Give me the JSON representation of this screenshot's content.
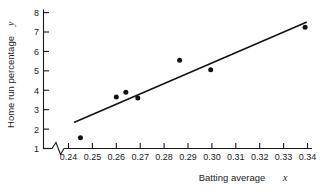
{
  "chart_data": {
    "type": "scatter",
    "title": "",
    "xlabel": "Batting average",
    "xlabel_symbol": "x",
    "ylabel": "Home run percentage",
    "ylabel_symbol": "y",
    "xlim": [
      0.2355,
      0.3435
    ],
    "ylim": [
      1,
      8.45
    ],
    "grid": false,
    "legend": null,
    "x_axis_break": true,
    "xticks": [
      0.24,
      0.25,
      0.26,
      0.27,
      0.28,
      0.29,
      0.3,
      0.31,
      0.32,
      0.33,
      0.34
    ],
    "xtick_labels": [
      "0.24",
      "0.25",
      "0.26",
      "0.27",
      "0.28",
      "0.29",
      "0.30",
      "0.31",
      "0.32",
      "0.33",
      "0.34"
    ],
    "yticks": [
      1,
      2,
      3,
      4,
      5,
      6,
      7,
      8
    ],
    "ytick_labels": [
      "1",
      "2",
      "3",
      "4",
      "5",
      "6",
      "7",
      "8"
    ],
    "points": [
      {
        "x": 0.245,
        "y": 1.55
      },
      {
        "x": 0.26,
        "y": 3.65
      },
      {
        "x": 0.264,
        "y": 3.9
      },
      {
        "x": 0.269,
        "y": 3.6
      },
      {
        "x": 0.2865,
        "y": 5.55
      },
      {
        "x": 0.2995,
        "y": 5.05
      },
      {
        "x": 0.339,
        "y": 7.25
      }
    ],
    "series": [
      {
        "name": "Home run percentage",
        "x": [
          0.245,
          0.26,
          0.264,
          0.269,
          0.2865,
          0.2995,
          0.339
        ],
        "values": [
          1.55,
          3.65,
          3.9,
          3.6,
          5.55,
          5.05,
          7.25
        ]
      }
    ],
    "fit_line": {
      "type": "linear-regression",
      "x_start": 0.2425,
      "y_start": 2.35,
      "x_end": 0.3395,
      "y_end": 7.5
    },
    "colors": {
      "point": "#111111",
      "line": "#111111",
      "axis": "#1a1a1a",
      "background": "#ffffff"
    }
  }
}
